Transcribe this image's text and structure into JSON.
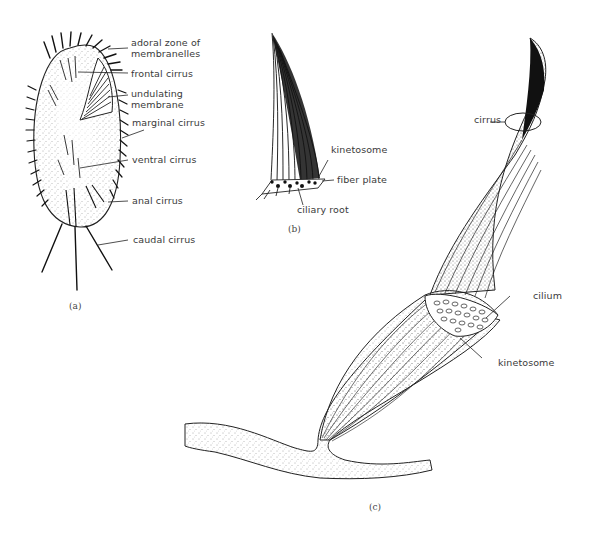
{
  "figure": {
    "panels": [
      {
        "id": "a",
        "caption": "(a)",
        "subject": "hypotrich ciliate (whole cell, ventral view)",
        "labels": [
          "adoral zone of membranelles",
          "frontal cirrus",
          "undulating membrane",
          "marginal cirrus",
          "ventral cirrus",
          "anal cirrus",
          "caudal cirrus"
        ]
      },
      {
        "id": "b",
        "caption": "(b)",
        "subject": "single cirrus with basal structures",
        "labels": [
          "kinetosome",
          "fiber plate",
          "ciliary root"
        ]
      },
      {
        "id": "c",
        "caption": "(c)",
        "subject": "enlarged cirrus showing bundled cilia",
        "labels": [
          "cirrus",
          "cilium",
          "kinetosome"
        ]
      }
    ]
  },
  "labels_a": {
    "adoral_line1": "adoral zone of",
    "adoral_line2": "membranelles",
    "frontal": "frontal cirrus",
    "undulating_line1": "undulating",
    "undulating_line2": "membrane",
    "marginal": "marginal cirrus",
    "ventral": "ventral cirrus",
    "anal": "anal cirrus",
    "caudal": "caudal cirrus",
    "caption": "(a)"
  },
  "labels_b": {
    "kinetosome": "kinetosome",
    "fiber_plate": "fiber plate",
    "ciliary_root": "ciliary root",
    "caption": "(b)"
  },
  "labels_c": {
    "cirrus": "cirrus",
    "cilium": "cilium",
    "kinetosome": "kinetosome",
    "caption": "(c)"
  }
}
